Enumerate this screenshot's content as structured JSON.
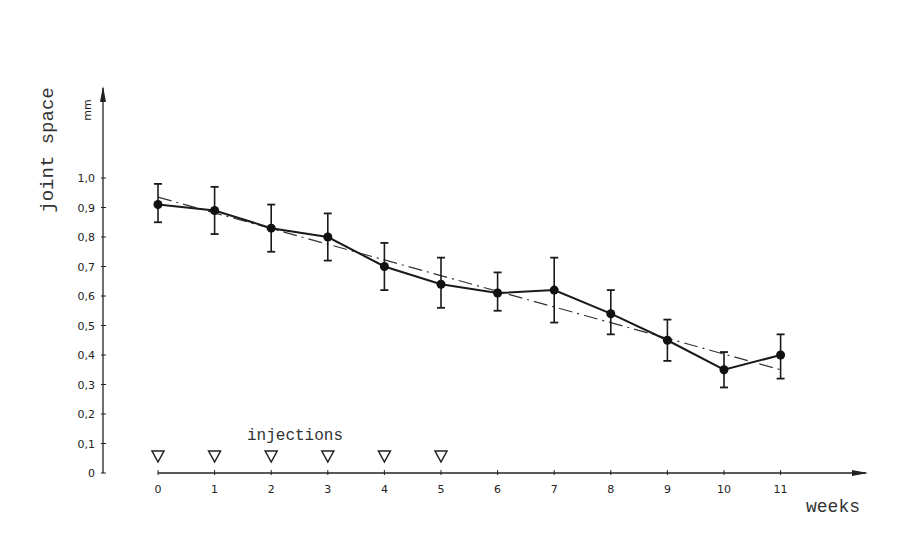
{
  "chart_data": {
    "type": "line",
    "title": "",
    "ylabel": "joint space",
    "yunit": "mm",
    "xlabel": "weeks",
    "ylim": [
      0,
      1.0
    ],
    "xlim": [
      0,
      11
    ],
    "grid": false,
    "yticks": [
      "0",
      "0,1",
      "0,2",
      "0,3",
      "0,4",
      "0,5",
      "0,6",
      "0,7",
      "0,8",
      "0,9",
      "1,0"
    ],
    "xticks": [
      "0",
      "1",
      "2",
      "3",
      "4",
      "5",
      "6",
      "7",
      "8",
      "9",
      "10",
      "11"
    ],
    "x": [
      0,
      1,
      2,
      3,
      4,
      5,
      6,
      7,
      8,
      9,
      10,
      11
    ],
    "series": [
      {
        "name": "mean joint space",
        "style": "solid line with filled circle markers and error bars",
        "values": [
          0.91,
          0.89,
          0.83,
          0.8,
          0.7,
          0.64,
          0.61,
          0.62,
          0.54,
          0.45,
          0.35,
          0.4
        ],
        "error_upper": [
          0.98,
          0.97,
          0.91,
          0.88,
          0.78,
          0.73,
          0.68,
          0.73,
          0.62,
          0.52,
          0.41,
          0.47
        ],
        "error_lower": [
          0.85,
          0.81,
          0.75,
          0.72,
          0.62,
          0.56,
          0.55,
          0.51,
          0.47,
          0.38,
          0.29,
          0.32
        ]
      },
      {
        "name": "regression line",
        "style": "dash-dot",
        "values": [
          0.935,
          0.88,
          0.825,
          0.77,
          0.72,
          0.665,
          0.61,
          0.56,
          0.505,
          0.45,
          0.4,
          0.35
        ]
      }
    ],
    "annotations": [
      {
        "text": "injections",
        "marker": "open downward triangle",
        "at_weeks": [
          0,
          1,
          2,
          3,
          4,
          5
        ]
      }
    ]
  },
  "labels": {
    "y_title": "joint space",
    "y_unit": "mm",
    "x_title": "weeks",
    "injections": "injections"
  }
}
